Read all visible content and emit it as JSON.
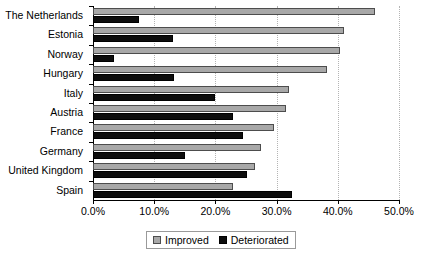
{
  "chart_data": {
    "type": "bar",
    "orientation": "horizontal",
    "title": "",
    "xlabel": "",
    "ylabel": "",
    "xlim": [
      0,
      50
    ],
    "xtick_labels": [
      "0.0%",
      "10.0%",
      "20.0%",
      "30.0%",
      "40.0%",
      "50.0%"
    ],
    "xtick_values": [
      0,
      10,
      20,
      30,
      40,
      50
    ],
    "grid": true,
    "grid_axis": "x",
    "legend_position": "bottom-center",
    "categories": [
      "The Netherlands",
      "Estonia",
      "Norway",
      "Hungary",
      "Italy",
      "Austria",
      "France",
      "Germany",
      "United Kingdom",
      "Spain"
    ],
    "series": [
      {
        "name": "Improved",
        "color": "#a8a8a8",
        "values": [
          46.0,
          41.0,
          40.3,
          38.3,
          32.0,
          31.5,
          29.5,
          27.5,
          26.5,
          22.8
        ]
      },
      {
        "name": "Deteriorated",
        "color": "#0d0d0d",
        "values": [
          7.5,
          13.0,
          3.5,
          13.3,
          20.0,
          22.8,
          24.5,
          15.0,
          25.2,
          32.5
        ]
      }
    ]
  },
  "legend": {
    "items": [
      {
        "label": "Improved",
        "swatch": "improved"
      },
      {
        "label": "Deteriorated",
        "swatch": "deteriorated"
      }
    ]
  }
}
